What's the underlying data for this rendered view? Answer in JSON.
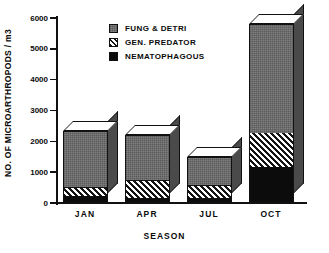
{
  "chart_data": {
    "type": "bar",
    "subtype": "stacked-bar-3d",
    "title": "",
    "xlabel": "SEASON",
    "ylabel": "NO. OF MICROARTHROPODS / m3",
    "categories": [
      "JAN",
      "APR",
      "JUL",
      "OCT"
    ],
    "ylim": [
      0,
      6000
    ],
    "ytick_labels": [
      "0",
      "1000",
      "2000",
      "3000",
      "4000",
      "5000",
      "6000"
    ],
    "ytick_values": [
      0,
      1000,
      2000,
      3000,
      4000,
      5000,
      6000
    ],
    "grid": false,
    "legend_position": "top-center",
    "stack_order_bottom_to_top": [
      "NEMATOPHAGOUS",
      "GEN. PREDATOR",
      "FUNG & DETRI"
    ],
    "series": [
      {
        "name": "FUNG & DETRI",
        "fill": "dark-gray-stipple",
        "color": "#6d6d6d",
        "values": [
          1850,
          1490,
          940,
          3550
        ]
      },
      {
        "name": "GEN. PREDATOR",
        "fill": "diagonal-hatch",
        "color": "#cfcfcf",
        "values": [
          280,
          580,
          420,
          1100
        ]
      },
      {
        "name": "NEMATOPHAGOUS",
        "fill": "solid-black",
        "color": "#0c0c0c",
        "values": [
          200,
          130,
          120,
          1150
        ]
      }
    ],
    "totals": [
      2330,
      2200,
      1480,
      5800
    ]
  },
  "legend": {
    "items": [
      {
        "label": "FUNG & DETRI",
        "swatch": "fung"
      },
      {
        "label": "GEN. PREDATOR",
        "swatch": "pred"
      },
      {
        "label": "NEMATOPHAGOUS",
        "swatch": "nema"
      }
    ]
  },
  "colors": {
    "axis": "#111111",
    "text": "#0a0a0a",
    "background": "#ffffff",
    "bar_top_face": "#ffffff",
    "bar_side_face": "#4a4a4a",
    "bar_side_face_dark": "#141414"
  }
}
